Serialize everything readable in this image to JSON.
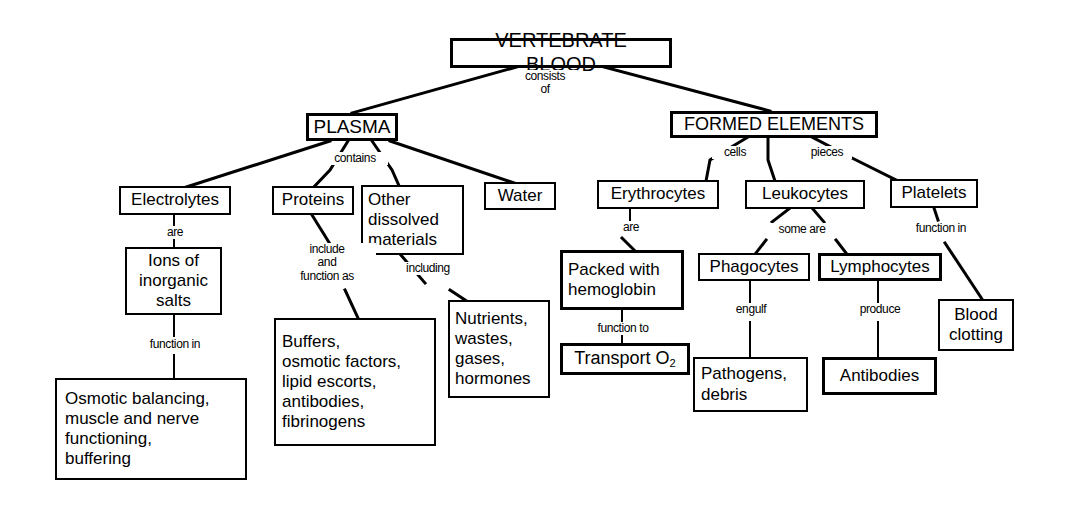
{
  "colors": {
    "stroke": "#000000",
    "background": "#ffffff",
    "text": "#000000"
  },
  "nodes": {
    "vertebrate_blood": "VERTEBRATE BLOOD",
    "plasma": "PLASMA",
    "formed_elements": "FORMED ELEMENTS",
    "electrolytes": "Electrolytes",
    "proteins": "Proteins",
    "other_dissolved": "Other\ndissolved\nmaterials",
    "water": "Water",
    "erythrocytes": "Erythrocytes",
    "leukocytes": "Leukocytes",
    "platelets": "Platelets",
    "ions": "Ions of\ninorganic\nsalts",
    "buffers": "Buffers,\nosmotic factors,\nlipid escorts,\nantibodies,\nfibrinogens",
    "nutrients": "Nutrients,\nwastes,\ngases,\nhormones",
    "packed_hemoglobin": "Packed with\nhemoglobin",
    "phagocytes": "Phagocytes",
    "lymphocytes": "Lymphocytes",
    "blood_clotting": "Blood\nclotting",
    "osmotic_balancing": "Osmotic balancing,\nmuscle and  nerve\nfunctioning,\nbuffering",
    "transport_o2_pre": "Transport O",
    "transport_o2_sub": "2",
    "pathogens": "Pathogens,\ndebris",
    "antibodies": "Antibodies"
  },
  "link_labels": {
    "consists_of": "consists\nof",
    "contains": "contains",
    "cells": "cells",
    "pieces": "pieces",
    "are_electrolytes": "are",
    "include_function_as": "include\nand\nfunction as",
    "including": "including",
    "function_in_ions": "function in",
    "are_erythrocytes": "are",
    "some_are": "some are",
    "function_in_platelets": "function in",
    "function_to": "function to",
    "engulf": "engulf",
    "produce": "produce"
  },
  "edges": [
    {
      "from": "vertebrate_blood",
      "to": "plasma",
      "label": "consists_of"
    },
    {
      "from": "vertebrate_blood",
      "to": "formed_elements",
      "label": "consists_of"
    },
    {
      "from": "plasma",
      "to": "electrolytes",
      "label": "contains"
    },
    {
      "from": "plasma",
      "to": "proteins",
      "label": "contains"
    },
    {
      "from": "plasma",
      "to": "other_dissolved",
      "label": "contains"
    },
    {
      "from": "plasma",
      "to": "water",
      "label": "contains"
    },
    {
      "from": "formed_elements",
      "to": "erythrocytes",
      "label": "cells"
    },
    {
      "from": "formed_elements",
      "to": "leukocytes",
      "label": "cells"
    },
    {
      "from": "formed_elements",
      "to": "platelets",
      "label": "pieces"
    },
    {
      "from": "electrolytes",
      "to": "ions",
      "label": "are_electrolytes"
    },
    {
      "from": "ions",
      "to": "osmotic_balancing",
      "label": "function_in_ions"
    },
    {
      "from": "proteins",
      "to": "buffers",
      "label": "include_function_as"
    },
    {
      "from": "other_dissolved",
      "to": "nutrients",
      "label": "including"
    },
    {
      "from": "erythrocytes",
      "to": "packed_hemoglobin",
      "label": "are_erythrocytes"
    },
    {
      "from": "packed_hemoglobin",
      "to": "transport_o2",
      "label": "function_to"
    },
    {
      "from": "leukocytes",
      "to": "phagocytes",
      "label": "some_are"
    },
    {
      "from": "leukocytes",
      "to": "lymphocytes",
      "label": "some_are"
    },
    {
      "from": "platelets",
      "to": "blood_clotting",
      "label": "function_in_platelets"
    },
    {
      "from": "phagocytes",
      "to": "pathogens",
      "label": "engulf"
    },
    {
      "from": "lymphocytes",
      "to": "antibodies",
      "label": "produce"
    }
  ]
}
